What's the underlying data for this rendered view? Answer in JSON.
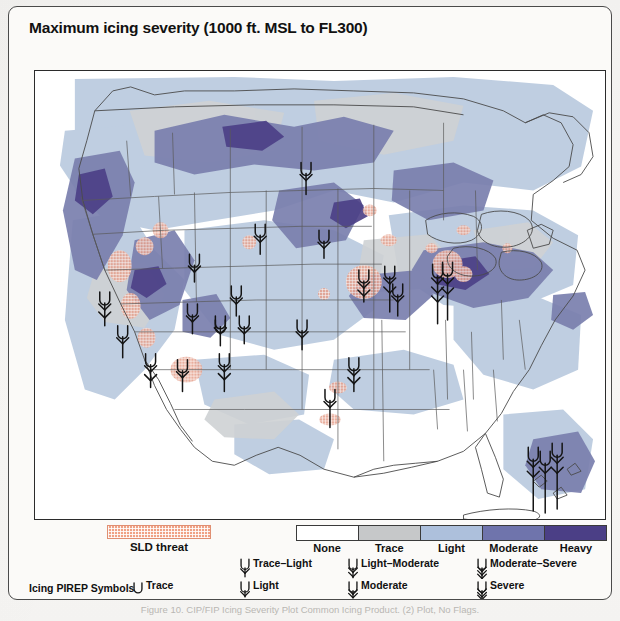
{
  "figure": {
    "title": "Maximum icing severity (1000 ft. MSL to FL300)",
    "caption": "Figure 10.    CIP/FIP Icing Severity Plot Common Icing Product. (2) Plot, No Flags."
  },
  "legend": {
    "sld": {
      "label": "SLD threat",
      "color": "#f0a184",
      "pattern": "crosshatch"
    },
    "severity_bar": {
      "steps": [
        {
          "label": "None",
          "color": "#ffffff"
        },
        {
          "label": "Trace",
          "color": "#c6c8c9"
        },
        {
          "label": "Light",
          "color": "#adc0dc"
        },
        {
          "label": "Moderate",
          "color": "#6f74ac"
        },
        {
          "label": "Heavy",
          "color": "#4b3f86"
        }
      ]
    },
    "pirep": {
      "heading": "Icing PIREP Symbols",
      "symbols": [
        {
          "name": "trace",
          "label": "Trace",
          "barbs": 0,
          "shape": "u"
        },
        {
          "name": "light",
          "label": "Light",
          "barbs": 1,
          "shape": "u-stem"
        },
        {
          "name": "moderate",
          "label": "Moderate",
          "barbs": 2,
          "shape": "u-stem"
        },
        {
          "name": "severe",
          "label": "Severe",
          "barbs": 3,
          "shape": "u-stem"
        },
        {
          "name": "trace-light",
          "label": "Trace–Light",
          "barbs": 1,
          "shape": "u-stem-tall"
        },
        {
          "name": "light-moderate",
          "label": "Light–Moderate",
          "barbs": 2,
          "shape": "u-stem-tall"
        },
        {
          "name": "moderate-severe",
          "label": "Moderate–Severe",
          "barbs": 3,
          "shape": "u-stem-tall"
        }
      ]
    }
  },
  "map": {
    "name": "conus-icing-severity-map",
    "projection": "lambert-conformal-conus",
    "background": "#ffffff",
    "border_color": "#2b2b2b",
    "coastline_color": "#4a4a4a",
    "pirep_marker_color": "#1a1a1a",
    "fields": [
      {
        "severity": "Trace",
        "color": "#c6c8c9"
      },
      {
        "severity": "Light",
        "color": "#adc0dc"
      },
      {
        "severity": "Moderate",
        "color": "#6f74ac"
      },
      {
        "severity": "Heavy",
        "color": "#4b3f86"
      },
      {
        "severity": "SLD",
        "color": "#c98873"
      }
    ],
    "pirep_count_visible": 22
  }
}
